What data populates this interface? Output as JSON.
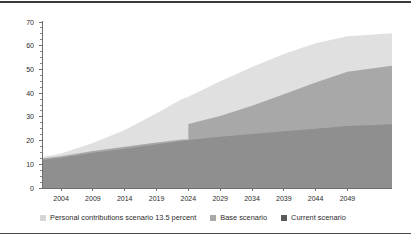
{
  "figure": {
    "background_color": "#ffffff",
    "rule_color": "#3a3a3a"
  },
  "chart_data": {
    "type": "area",
    "title": "",
    "subtitle": "",
    "xlabel": "",
    "ylabel": "",
    "xlim": [
      2001,
      2056
    ],
    "ylim": [
      0,
      70
    ],
    "grid": false,
    "stacked": false,
    "legend_position": "bottom-left",
    "x_tick_labels": [
      "2004",
      "2009",
      "2014",
      "2019",
      "2024",
      "2029",
      "2034",
      "2039",
      "2044",
      "2049"
    ],
    "x_ticks": [
      2004,
      2009,
      2014,
      2019,
      2024,
      2029,
      2034,
      2039,
      2044,
      2049
    ],
    "y_tick_labels": [
      "0",
      "10",
      "20",
      "30",
      "40",
      "50",
      "60",
      "70"
    ],
    "y_ticks": [
      0,
      10,
      20,
      30,
      40,
      50,
      60,
      70
    ],
    "y_minor_tick_interval": 2.5,
    "x": [
      2001,
      2004,
      2009,
      2014,
      2019,
      2023,
      2024,
      2029,
      2034,
      2039,
      2044,
      2049,
      2056
    ],
    "series": [
      {
        "name": "Personal contributions scenario 13.5 percent",
        "color": "#e0e0e0",
        "values": [
          13.0,
          14.5,
          19.0,
          24.5,
          31.5,
          37.5,
          38.5,
          45.0,
          51.0,
          56.5,
          61.0,
          64.0,
          65.3
        ]
      },
      {
        "name": "Base scenario",
        "color": "#a8a8a8",
        "values": [
          12.4,
          13.4,
          15.6,
          17.4,
          19.2,
          20.4,
          27.0,
          30.4,
          34.7,
          39.5,
          44.5,
          49.0,
          51.6
        ]
      },
      {
        "name": "Current scenario",
        "color": "#8f8f8f",
        "values": [
          11.8,
          12.8,
          14.9,
          16.6,
          18.4,
          19.8,
          20.2,
          21.6,
          22.8,
          23.9,
          25.0,
          26.1,
          26.9
        ]
      }
    ],
    "annotations": [
      {
        "kind": "step",
        "series": "Base scenario",
        "x": 2024,
        "from_value": 20.4,
        "to_value": 27.0
      }
    ]
  },
  "axis": {
    "y_axis_line_color": "#6e6e6e",
    "x_axis_line_color": "#6e6e6e"
  },
  "legend": {
    "items": [
      {
        "label": "Personal contributions scenario 13.5 percent",
        "color": "#d6d6d6",
        "swatch_name": "legend-swatch-personal"
      },
      {
        "label": "Base scenario",
        "color": "#a8a8a8",
        "swatch_name": "legend-swatch-base"
      },
      {
        "label": "Current scenario",
        "color": "#5a5a5a",
        "swatch_name": "legend-swatch-current"
      }
    ]
  }
}
